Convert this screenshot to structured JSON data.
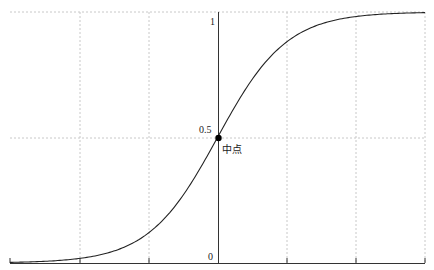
{
  "chart_data": {
    "type": "line",
    "title": "",
    "xlabel": "",
    "ylabel": "",
    "function": "logistic sigmoid",
    "xlim": [
      -6,
      6
    ],
    "ylim": [
      0,
      1
    ],
    "x": [
      -6,
      -5,
      -4,
      -3,
      -2,
      -1,
      0,
      1,
      2,
      3,
      4,
      5,
      6
    ],
    "values": [
      0.0025,
      0.0067,
      0.018,
      0.047,
      0.119,
      0.269,
      0.5,
      0.731,
      0.881,
      0.953,
      0.982,
      0.993,
      0.9975
    ],
    "y_tick_labels": [
      "0",
      "0.5",
      "1"
    ],
    "x_ticks": [
      -6,
      -4,
      -2,
      0,
      2,
      4,
      6
    ],
    "grid": true,
    "annotation": {
      "label": "中点",
      "x": 0,
      "y": 0.5
    }
  },
  "labels": {
    "y_zero": "0",
    "y_half": "0.5",
    "y_one": "1",
    "midpoint": "中点"
  },
  "colors": {
    "curve": "#222222",
    "axis": "#333333",
    "grid": "#bbbbbb"
  }
}
